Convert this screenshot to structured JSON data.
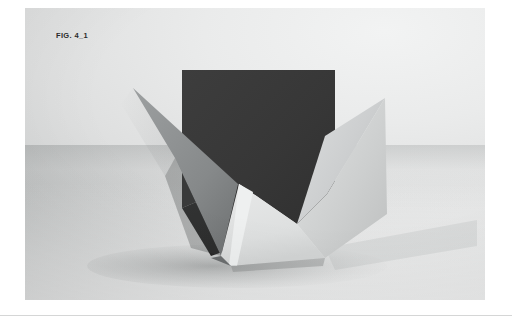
{
  "page": {
    "background_color": "#ffffff",
    "width": 512,
    "height": 322
  },
  "figure": {
    "label": "FIG. 4_1",
    "label_color": "#2b2b2b",
    "caption_position": "top-left"
  },
  "plate": {
    "name": "photograph-plate",
    "backdrop_light_color": "#f2f3f3",
    "backdrop_mid_color": "#dedfdf",
    "backdrop_dark_color": "#c4c6c6",
    "horizon_shadow_color": "#a8abab"
  },
  "subject": {
    "description": "Folded paper sculpture with dark back panel and two pointed wings",
    "parts": [
      {
        "name": "back-panel",
        "tone": "dark",
        "color": "#383838"
      },
      {
        "name": "left-wing",
        "tone": "mid-gray",
        "color": "#8d9091"
      },
      {
        "name": "right-wing",
        "tone": "light-gray",
        "color": "#d3d5d5"
      },
      {
        "name": "front-left-facet",
        "tone": "light",
        "color": "#e2e3e3"
      },
      {
        "name": "front-right-facet",
        "tone": "light-dim",
        "color": "#cdcfcf"
      },
      {
        "name": "inner-shadow",
        "tone": "deep",
        "color": "#2e2e2e"
      },
      {
        "name": "cast-shadow",
        "tone": "soft",
        "color": "#b6b8b8"
      }
    ]
  },
  "rule": {
    "color": "#d5d6d6"
  }
}
